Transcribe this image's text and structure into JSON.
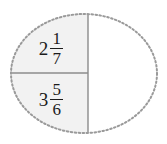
{
  "diagram": {
    "type": "ellipse-partition",
    "shape": {
      "name": "ellipse",
      "center_x": 84,
      "center_y": 73.5,
      "radius_x": 73,
      "radius_y": 59.5,
      "border_style": "dotted",
      "border_color": "#9a9a9a",
      "border_width": 2,
      "background_color": "#ffffff"
    },
    "regions": [
      {
        "id": "top-left",
        "name": "upper-left-region",
        "fill_color": "#f2f2f2",
        "label": {
          "whole": "2",
          "numerator": "1",
          "denominator": "7",
          "text": "2 1/7"
        }
      },
      {
        "id": "bottom-left",
        "name": "lower-left-region",
        "fill_color": "#f2f2f2",
        "label": {
          "whole": "3",
          "numerator": "5",
          "denominator": "6",
          "text": "3 5/6"
        }
      },
      {
        "id": "right",
        "name": "right-region",
        "fill_color": "#ffffff",
        "label": {
          "whole": "",
          "numerator": "",
          "denominator": "",
          "text": ""
        }
      }
    ],
    "dividers": [
      {
        "id": "vertical-divider",
        "orientation": "vertical",
        "x": 88,
        "y1": 15,
        "y2": 132,
        "color": "#8c8c8c",
        "width": 1.4
      },
      {
        "id": "horizontal-divider",
        "orientation": "horizontal",
        "x1": 11,
        "x2": 88,
        "y": 73,
        "color": "#8c8c8c",
        "width": 1.4
      }
    ],
    "colors": {
      "shaded_fill": "#f2f2f2",
      "unshaded_fill": "#ffffff",
      "outline": "#9a9a9a",
      "divider": "#8c8c8c",
      "text": "#1b1b1b"
    }
  }
}
